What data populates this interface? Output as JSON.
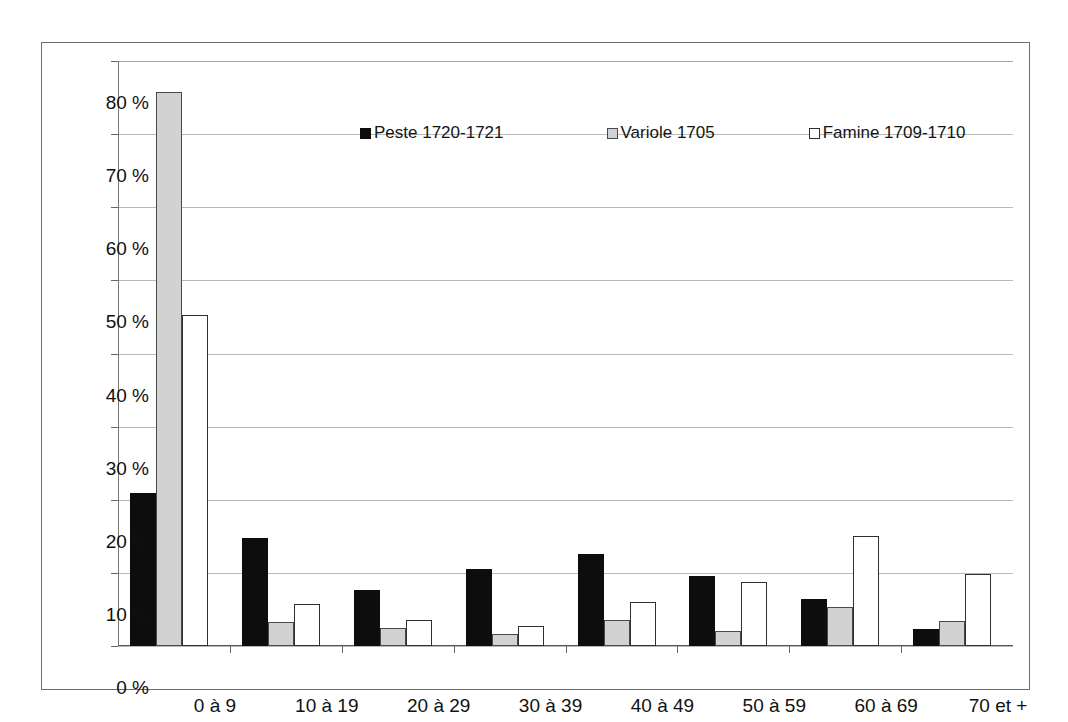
{
  "chart_data": {
    "type": "bar",
    "title": "",
    "subtitle": "",
    "xlabel": "",
    "ylabel": "",
    "ylim": [
      0,
      80
    ],
    "ytick_step": 10,
    "ytick_labels": [
      "0 %",
      "10 %",
      "20 %",
      "30 %",
      "40 %",
      "50 %",
      "60 %",
      "70 %",
      "80 %"
    ],
    "ytick_values": [
      0,
      10,
      20,
      30,
      40,
      50,
      60,
      70,
      80
    ],
    "grid": true,
    "grid_axis": "y",
    "legend_position": "top-center",
    "value_unit": "%",
    "categories": [
      "0 à 9",
      "10 à 19",
      "20 à 29",
      "30 à 39",
      "40 à 49",
      "50 à 59",
      "60 à 69",
      "70 et +"
    ],
    "series": [
      {
        "name": "Peste 1720-1721",
        "color": "#0d0d0d",
        "values": [
          20.9,
          14.8,
          7.7,
          10.6,
          12.6,
          9.6,
          6.4,
          2.3
        ]
      },
      {
        "name": "Variole 1705",
        "color": "#d2d2d2",
        "values": [
          75.8,
          3.3,
          2.5,
          1.7,
          3.6,
          2.0,
          5.3,
          3.4
        ]
      },
      {
        "name": "Famine 1709-1710",
        "color": "#ffffff",
        "values": [
          45.3,
          5.8,
          3.6,
          2.8,
          6.0,
          8.8,
          15.1,
          9.9
        ]
      }
    ]
  },
  "legend": {
    "items": [
      {
        "label": "Peste 1720-1721"
      },
      {
        "label": "Variole 1705"
      },
      {
        "label": "Famine 1709-1710"
      }
    ]
  },
  "colors": {
    "series_peste": "#0d0d0d",
    "series_variole": "#d2d2d2",
    "series_famine": "#ffffff",
    "grid": "#b9b9b9",
    "axis": "#666666",
    "frame": "#6d6d6d",
    "text": "#111111",
    "background": "#ffffff"
  }
}
